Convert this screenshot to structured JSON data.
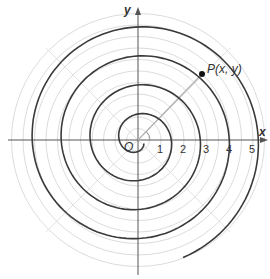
{
  "diagram": {
    "type": "archimedean-spiral-polar-plot",
    "axis_labels": {
      "x": "x",
      "y": "y"
    },
    "origin_label": "O",
    "point_label": "P(x, y)",
    "tick_labels": [
      "1",
      "2",
      "3",
      "4",
      "5"
    ],
    "colors": {
      "spiral": "#3a3a3a",
      "grid": "#d9d9d9",
      "axis": "#555555",
      "ray": "#b0b0b0",
      "point": "#111111"
    }
  },
  "chart_data": {
    "type": "line",
    "title": "",
    "xlabel": "x",
    "ylabel": "y",
    "xticks": [
      1,
      2,
      3,
      4,
      5
    ],
    "grid": "polar circles at r = 0.5..5.5 step 0.5, radial lines every 45°",
    "curve": "Archimedean spiral r = a·θ",
    "point": {
      "label": "P(x, y)",
      "approx_r": 4.6,
      "approx_theta_deg": 45
    }
  }
}
